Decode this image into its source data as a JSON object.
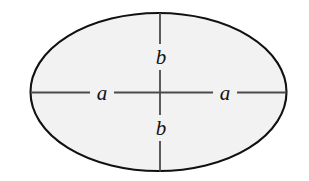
{
  "figure": {
    "kind": "ellipse-semi-axis-diagram",
    "canvas": {
      "width": 309,
      "height": 181,
      "background": "#ffffff"
    },
    "ellipse": {
      "center_x": 158.5,
      "center_y": 92,
      "radius_x": 128,
      "radius_y": 79,
      "fill": "#f2f2f2",
      "stroke": "#111111",
      "stroke_width": 2.1
    },
    "axes": {
      "stroke": "#4a4a4a",
      "stroke_width": 1.8,
      "horizontal": {
        "x1": 30.5,
        "x2": 286.5,
        "y": 92.5
      },
      "vertical": {
        "y1": 13,
        "y2": 171.5,
        "x": 160
      }
    },
    "labels": [
      {
        "name": "semi-axis-a-left",
        "text": "a",
        "x": 102,
        "y": 93
      },
      {
        "name": "semi-axis-a-right",
        "text": "a",
        "x": 225,
        "y": 93
      },
      {
        "name": "semi-axis-b-top",
        "text": "b",
        "x": 161,
        "y": 57
      },
      {
        "name": "semi-axis-b-bottom",
        "text": "b",
        "x": 161,
        "y": 128
      }
    ],
    "label_gaps": {
      "horizontal_left": {
        "from": 90,
        "to": 114
      },
      "horizontal_right": {
        "from": 213,
        "to": 237
      },
      "vertical_top": {
        "from": 44,
        "to": 70
      },
      "vertical_bottom": {
        "from": 115,
        "to": 141
      }
    }
  }
}
